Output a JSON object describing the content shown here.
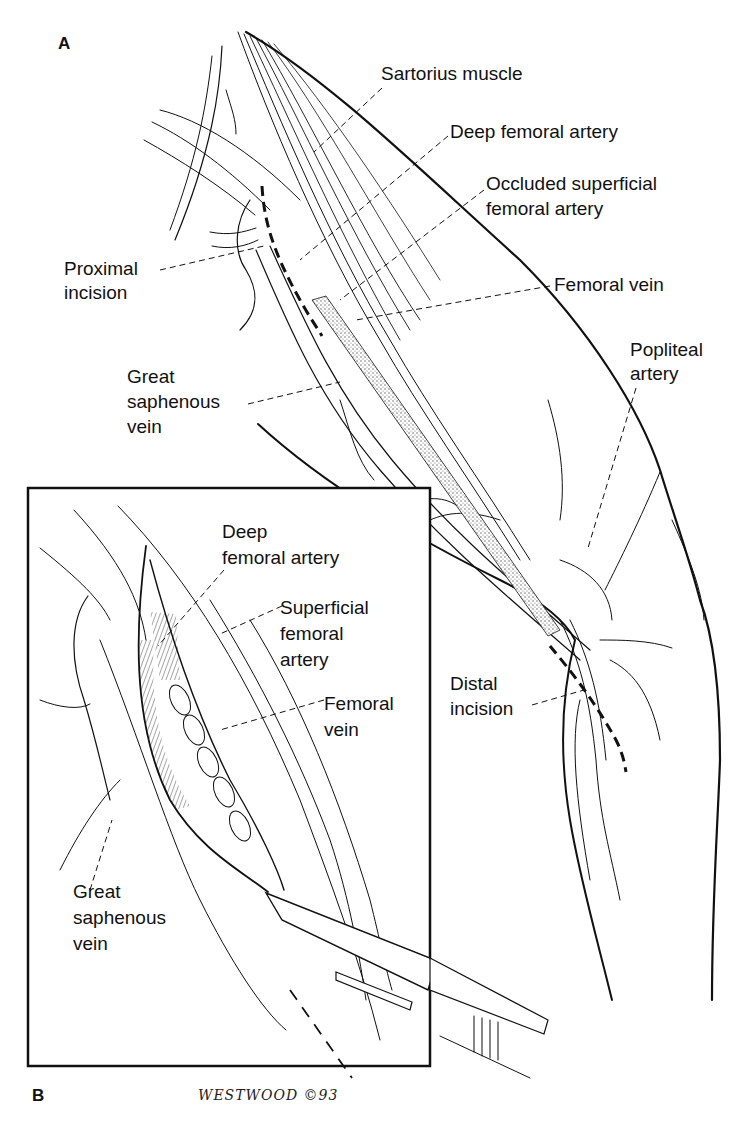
{
  "figure": {
    "panel_a": {
      "letter": "A",
      "labels": {
        "sartorius": "Sartorius muscle",
        "deep_femoral": "Deep femoral artery",
        "occluded_sfa_1": "Occluded superficial",
        "occluded_sfa_2": "femoral artery",
        "femoral_vein": "Femoral vein",
        "proximal_1": "Proximal",
        "proximal_2": "incision",
        "popliteal_1": "Popliteal",
        "popliteal_2": "artery",
        "gsv_1": "Great",
        "gsv_2": "saphenous",
        "gsv_3": "vein",
        "distal_1": "Distal",
        "distal_2": "incision"
      }
    },
    "panel_b": {
      "letter": "B",
      "labels": {
        "deep_1": "Deep",
        "deep_2": "femoral artery",
        "sfa_1": "Superficial",
        "sfa_2": "femoral",
        "sfa_3": "artery",
        "fv_1": "Femoral",
        "fv_2": "vein",
        "gsv_1": "Great",
        "gsv_2": "saphenous",
        "gsv_3": "vein"
      },
      "signature": "WESTWOOD ©93"
    },
    "colors": {
      "ink": "#111111",
      "background": "#ffffff",
      "stipple": "#9a9a9a"
    }
  }
}
